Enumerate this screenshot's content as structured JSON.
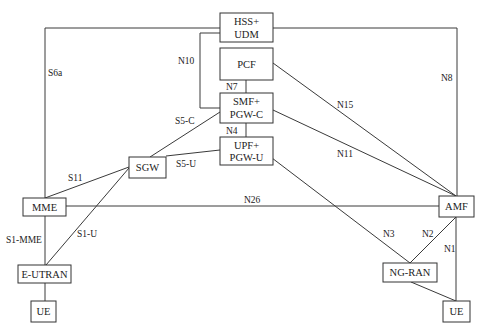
{
  "diagram": {
    "nodes": {
      "hss_udm": {
        "line1": "HSS+",
        "line2": "UDM"
      },
      "pcf": {
        "label": "PCF"
      },
      "smf_pgwc": {
        "line1": "SMF+",
        "line2": "PGW-C"
      },
      "upf_pgwu": {
        "line1": "UPF+",
        "line2": "PGW-U"
      },
      "sgw": {
        "label": "SGW"
      },
      "mme": {
        "label": "MME"
      },
      "eutran": {
        "label": "E-UTRAN"
      },
      "ue_left": {
        "label": "UE"
      },
      "amf": {
        "label": "AMF"
      },
      "ngran": {
        "label": "NG-RAN"
      },
      "ue_right": {
        "label": "UE"
      }
    },
    "interfaces": {
      "s6a": "S6a",
      "n8": "N8",
      "n10": "N10",
      "n7": "N7",
      "n4": "N4",
      "n15": "N15",
      "n11": "N11",
      "s5c": "S5-C",
      "s5u": "S5-U",
      "s11": "S11",
      "n26": "N26",
      "s1mme": "S1-MME",
      "s1u": "S1-U",
      "n3": "N3",
      "n2": "N2",
      "n1": "N1"
    },
    "colors": {
      "line": "#3a3a3a",
      "box_border": "#333333",
      "text": "#222222",
      "background": "#ffffff"
    }
  }
}
